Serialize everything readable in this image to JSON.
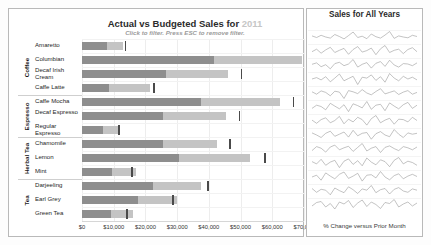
{
  "left_panel": {
    "title_main": "Actual vs Budgeted Sales for ",
    "title_year": "2011",
    "subtitle": "Click to filter. Press ESC to remove filter.",
    "axis": {
      "ticks": [
        "$0",
        "$10,000",
        "$20,000",
        "$30,000",
        "$40,000",
        "$50,000",
        "$60,000",
        "$70,000"
      ],
      "min": 0,
      "max": 70000
    }
  },
  "right_panel": {
    "title": "Sales for All Years",
    "footer": "% Change versus Prior Month"
  },
  "groups": [
    {
      "label": "Coffee",
      "start": 0,
      "count": 4
    },
    {
      "label": "Espresso",
      "start": 4,
      "count": 3
    },
    {
      "label": "Herbal Tea",
      "start": 7,
      "count": 3
    },
    {
      "label": "Tea",
      "start": 10,
      "count": 3
    }
  ],
  "chart_data": {
    "type": "bar",
    "title": "Actual vs Budgeted Sales for 2011",
    "xlabel": "",
    "ylabel": "",
    "xlim": [
      0,
      70000
    ],
    "grid": true,
    "orientation": "horizontal",
    "legend": "none",
    "categories": [
      "Amaretto",
      "Columbian",
      "Decaf Irish Cream",
      "Caffe Latte",
      "Caffe Mocha",
      "Decaf Espresso",
      "Regular Espresso",
      "Chamomile",
      "Lemon",
      "Mint",
      "Darjeeling",
      "Earl Grey",
      "Green Tea"
    ],
    "series": [
      {
        "name": "Actual Sales",
        "values": [
          12900,
          69500,
          46000,
          21500,
          62500,
          45500,
          11300,
          42500,
          53000,
          17000,
          37500,
          30000,
          16000
        ]
      },
      {
        "name": "Prior / Inner Sales",
        "values": [
          8000,
          41500,
          26500,
          8500,
          37500,
          25500,
          6500,
          25500,
          30500,
          9500,
          22500,
          17500,
          9000
        ]
      },
      {
        "name": "Budget Target",
        "values": [
          13500,
          71000,
          50000,
          22500,
          66500,
          49500,
          11500,
          46500,
          57500,
          15500,
          39500,
          28500,
          14000
        ]
      }
    ]
  },
  "sparklines": {
    "series": [
      {
        "name": "Amaretto",
        "values": [
          0.2,
          -0.1,
          0.3,
          0.0,
          -0.2,
          0.45,
          0.1,
          -0.35,
          0.25,
          0.9,
          -0.1,
          0.15,
          -0.3,
          0.55,
          0.05,
          -0.2,
          0.35,
          1.0,
          -0.25,
          0.2,
          0.0,
          -0.15,
          0.3,
          0.1
        ]
      },
      {
        "name": "Columbian",
        "values": [
          -0.1,
          0.25,
          -0.3,
          0.15,
          0.5,
          -0.2,
          0.1,
          0.35,
          -0.45,
          0.2,
          0.6,
          -0.15,
          0.05,
          0.4,
          -0.5,
          0.3,
          0.75,
          -0.2,
          0.1,
          0.25,
          -0.35,
          0.2,
          0.45,
          -0.1
        ]
      },
      {
        "name": "Decaf Irish Cream",
        "values": [
          0.1,
          0.3,
          -0.25,
          0.05,
          -0.55,
          0.2,
          0.4,
          -0.1,
          0.15,
          0.8,
          -0.3,
          0.1,
          0.35,
          -0.45,
          0.25,
          0.5,
          -0.2,
          0.7,
          0.0,
          -0.3,
          0.2,
          0.15,
          -0.1,
          0.3
        ]
      },
      {
        "name": "Caffe Latte",
        "values": [
          0.0,
          0.15,
          -0.1,
          0.25,
          -0.3,
          0.1,
          0.55,
          -0.2,
          0.05,
          0.3,
          -0.6,
          0.2,
          0.1,
          0.45,
          -0.15,
          0.25,
          -0.35,
          0.6,
          0.1,
          -0.2,
          0.3,
          0.0,
          0.2,
          -0.1
        ]
      },
      {
        "name": "Caffe Mocha",
        "values": [
          0.2,
          -0.2,
          0.35,
          0.1,
          -0.45,
          0.3,
          0.15,
          -0.9,
          0.4,
          0.2,
          -0.1,
          0.55,
          0.0,
          -0.3,
          0.25,
          0.7,
          -0.15,
          0.1,
          0.35,
          -0.25,
          0.15,
          0.4,
          -0.2,
          0.1
        ]
      },
      {
        "name": "Decaf Espresso",
        "values": [
          -0.15,
          0.2,
          0.05,
          -0.3,
          0.4,
          0.1,
          -0.2,
          0.25,
          -0.5,
          0.35,
          0.15,
          -0.1,
          0.6,
          -0.25,
          0.2,
          0.3,
          -0.4,
          0.45,
          0.1,
          -0.2,
          0.25,
          0.5,
          -0.15,
          0.2
        ]
      },
      {
        "name": "Regular Espresso",
        "values": [
          0.1,
          -0.25,
          0.15,
          0.35,
          -0.2,
          0.05,
          0.5,
          -0.3,
          0.2,
          -0.1,
          0.4,
          0.15,
          -0.45,
          0.25,
          0.6,
          -0.2,
          0.1,
          0.3,
          -0.35,
          0.2,
          0.15,
          -0.1,
          0.4,
          0.05
        ]
      },
      {
        "name": "Chamomile",
        "values": [
          0.25,
          0.0,
          -0.3,
          0.2,
          0.45,
          -0.15,
          0.1,
          0.35,
          -0.25,
          0.55,
          -0.1,
          0.2,
          0.3,
          -0.5,
          0.15,
          0.4,
          0.0,
          -0.2,
          0.65,
          0.1,
          -0.3,
          0.25,
          0.1,
          0.2
        ]
      },
      {
        "name": "Lemon",
        "values": [
          -0.2,
          0.3,
          0.1,
          -0.4,
          0.25,
          0.5,
          -0.1,
          0.15,
          0.35,
          -0.3,
          0.2,
          0.7,
          -0.25,
          0.1,
          0.3,
          -0.45,
          0.2,
          0.4,
          0.05,
          -0.2,
          0.3,
          0.15,
          -0.1,
          0.25
        ]
      },
      {
        "name": "Mint",
        "values": [
          0.15,
          -0.1,
          0.4,
          -0.25,
          0.1,
          0.3,
          -0.5,
          0.2,
          0.45,
          -0.15,
          0.25,
          -0.3,
          0.55,
          0.1,
          -0.2,
          0.35,
          0.15,
          -0.4,
          0.3,
          0.6,
          -0.1,
          0.2,
          0.05,
          -0.25
        ]
      },
      {
        "name": "Darjeeling",
        "values": [
          0.0,
          0.2,
          -0.35,
          0.45,
          0.1,
          -0.2,
          0.3,
          0.55,
          -0.15,
          0.1,
          0.4,
          -0.45,
          0.2,
          0.25,
          -0.1,
          0.6,
          0.0,
          -0.3,
          0.15,
          0.35,
          -0.2,
          0.1,
          0.3,
          0.05
        ]
      },
      {
        "name": "Earl Grey",
        "values": [
          0.3,
          -0.15,
          0.2,
          0.1,
          -0.45,
          0.35,
          0.05,
          -0.2,
          0.5,
          0.15,
          -0.3,
          0.25,
          0.1,
          0.65,
          -0.2,
          0.15,
          0.3,
          -0.35,
          0.2,
          0.4,
          0.0,
          -0.15,
          0.25,
          0.1
        ]
      },
      {
        "name": "Green Tea",
        "values": [
          -0.1,
          0.25,
          0.35,
          -0.2,
          0.15,
          -0.4,
          0.3,
          0.1,
          0.45,
          -0.25,
          0.2,
          0.5,
          -0.15,
          0.3,
          0.05,
          -0.35,
          0.25,
          0.15,
          0.55,
          -0.2,
          0.1,
          0.3,
          -0.1,
          0.2
        ]
      }
    ]
  },
  "colors": {
    "bar_outer": "#c4c4c4",
    "bar_inner": "#8e8e8e",
    "target_marker": "#4a4a4a",
    "panel_border": "#b9b9b9",
    "title_year": "#c6c6c6",
    "subtitle": "#9b9b9b",
    "sparkline": "#9a9a9a"
  }
}
